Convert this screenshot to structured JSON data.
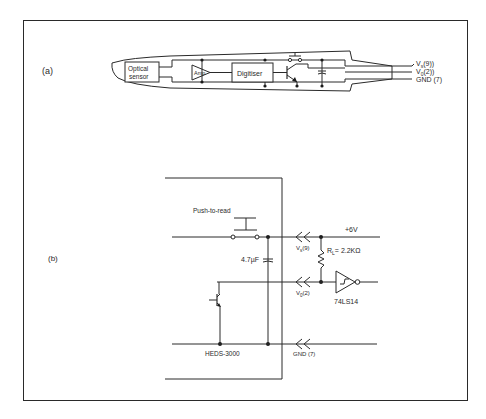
{
  "figure": {
    "colors": {
      "ink": "#2a2a2a",
      "background": "#ffffff"
    }
  },
  "panel_a": {
    "label": "(a)",
    "blocks": {
      "sensor_line1": "Optical",
      "sensor_line2": "sensor",
      "amp": "Amp",
      "digitiser": "Digitiser"
    },
    "pins": {
      "vs": "Vs(9)",
      "vs_main": "V",
      "vs_sub": "s",
      "vs_pin": "(9))",
      "vo_main": "V",
      "vo_sub": "0",
      "vo_pin": "(2))",
      "gnd": "GND (7)"
    }
  },
  "panel_b": {
    "label": "(b)",
    "switch_label": "Push-to-read",
    "supply": "+6V",
    "capacitor": "4.7µF",
    "resistor": "RL = 2.2KΩ",
    "resistor_main": "R",
    "resistor_sub": "L",
    "resistor_value": "= 2.2KΩ",
    "buffer": "74LS14",
    "module": "HEDS-3000",
    "pins": {
      "vs_main": "V",
      "vs_sub": "s",
      "vs_pin": "(9)",
      "vo_main": "V",
      "vo_sub": "0",
      "vo_pin": "(2)",
      "gnd": "GND (7)"
    }
  }
}
